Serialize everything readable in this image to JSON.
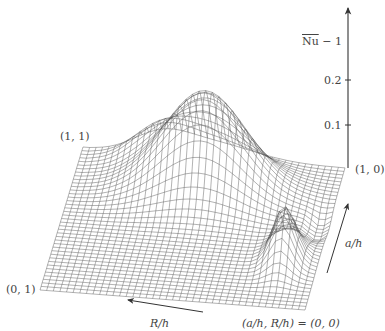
{
  "chart_data": {
    "type": "surface3d",
    "title": "",
    "zlabel": "Ñu − 1",
    "zlabel_parts": {
      "tilde_part": "Nu",
      "rest": " − 1"
    },
    "z_ticks": [
      "0.1",
      "0.2"
    ],
    "z_tick_values": [
      0.1,
      0.2
    ],
    "zlim": [
      0,
      0.3
    ],
    "x_axis": {
      "label": "a/h",
      "range": [
        0,
        1
      ]
    },
    "y_axis": {
      "label": "R/h",
      "range": [
        0,
        1
      ]
    },
    "corner_labels": {
      "c11": "(1, 1)",
      "c10": "(1, 0)",
      "c01": "(0, 1)",
      "c00": "(a/h, R/h) = (0, 0)"
    },
    "grid": {
      "resolution": 40,
      "style": "wireframe",
      "color": "#555555"
    },
    "features": [
      {
        "name": "main ridge",
        "a_h": 0.8,
        "R_h": 0.5,
        "peak": 0.22
      },
      {
        "name": "secondary peak",
        "a_h": 0.35,
        "R_h": 0.12,
        "peak": 0.12
      },
      {
        "name": "trough",
        "a_h": 0.6,
        "R_h": 0.05,
        "peak": -0.03
      }
    ],
    "grid_on": false,
    "legend": "none"
  },
  "labels": {
    "zaxis": "Ñu − 1",
    "tick_02": "0.2",
    "tick_01": "0.1",
    "corner_11": "(1, 1)",
    "corner_10": "(1, 0)",
    "corner_01": "(0, 1)",
    "origin": "(a/h, R/h) = (0, 0)",
    "a_h": "a/h",
    "r_h": "R/h"
  }
}
